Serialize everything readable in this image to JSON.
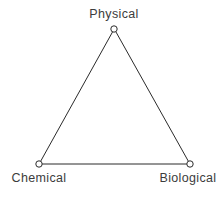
{
  "diagram": {
    "type": "triangle-relationship-diagram",
    "background_color": "#ffffff",
    "line_color": "#2b2b2b",
    "line_width": 1,
    "marker": {
      "shape": "open-circle",
      "radius": 3.2,
      "fill": "#ffffff",
      "stroke": "#2b2b2b",
      "stroke_width": 1
    },
    "text_color": "#3c3c3c",
    "nodes": [
      {
        "id": "physical",
        "label": "Physical",
        "x": 114,
        "y": 29,
        "label_position": "above"
      },
      {
        "id": "chemical",
        "label": "Chemical",
        "x": 39,
        "y": 164,
        "label_position": "below"
      },
      {
        "id": "biological",
        "label": "Biological",
        "x": 190,
        "y": 164,
        "label_position": "below"
      }
    ],
    "edges": [
      {
        "from": "chemical",
        "to": "physical"
      },
      {
        "from": "physical",
        "to": "biological"
      },
      {
        "from": "chemical",
        "to": "biological"
      }
    ]
  }
}
